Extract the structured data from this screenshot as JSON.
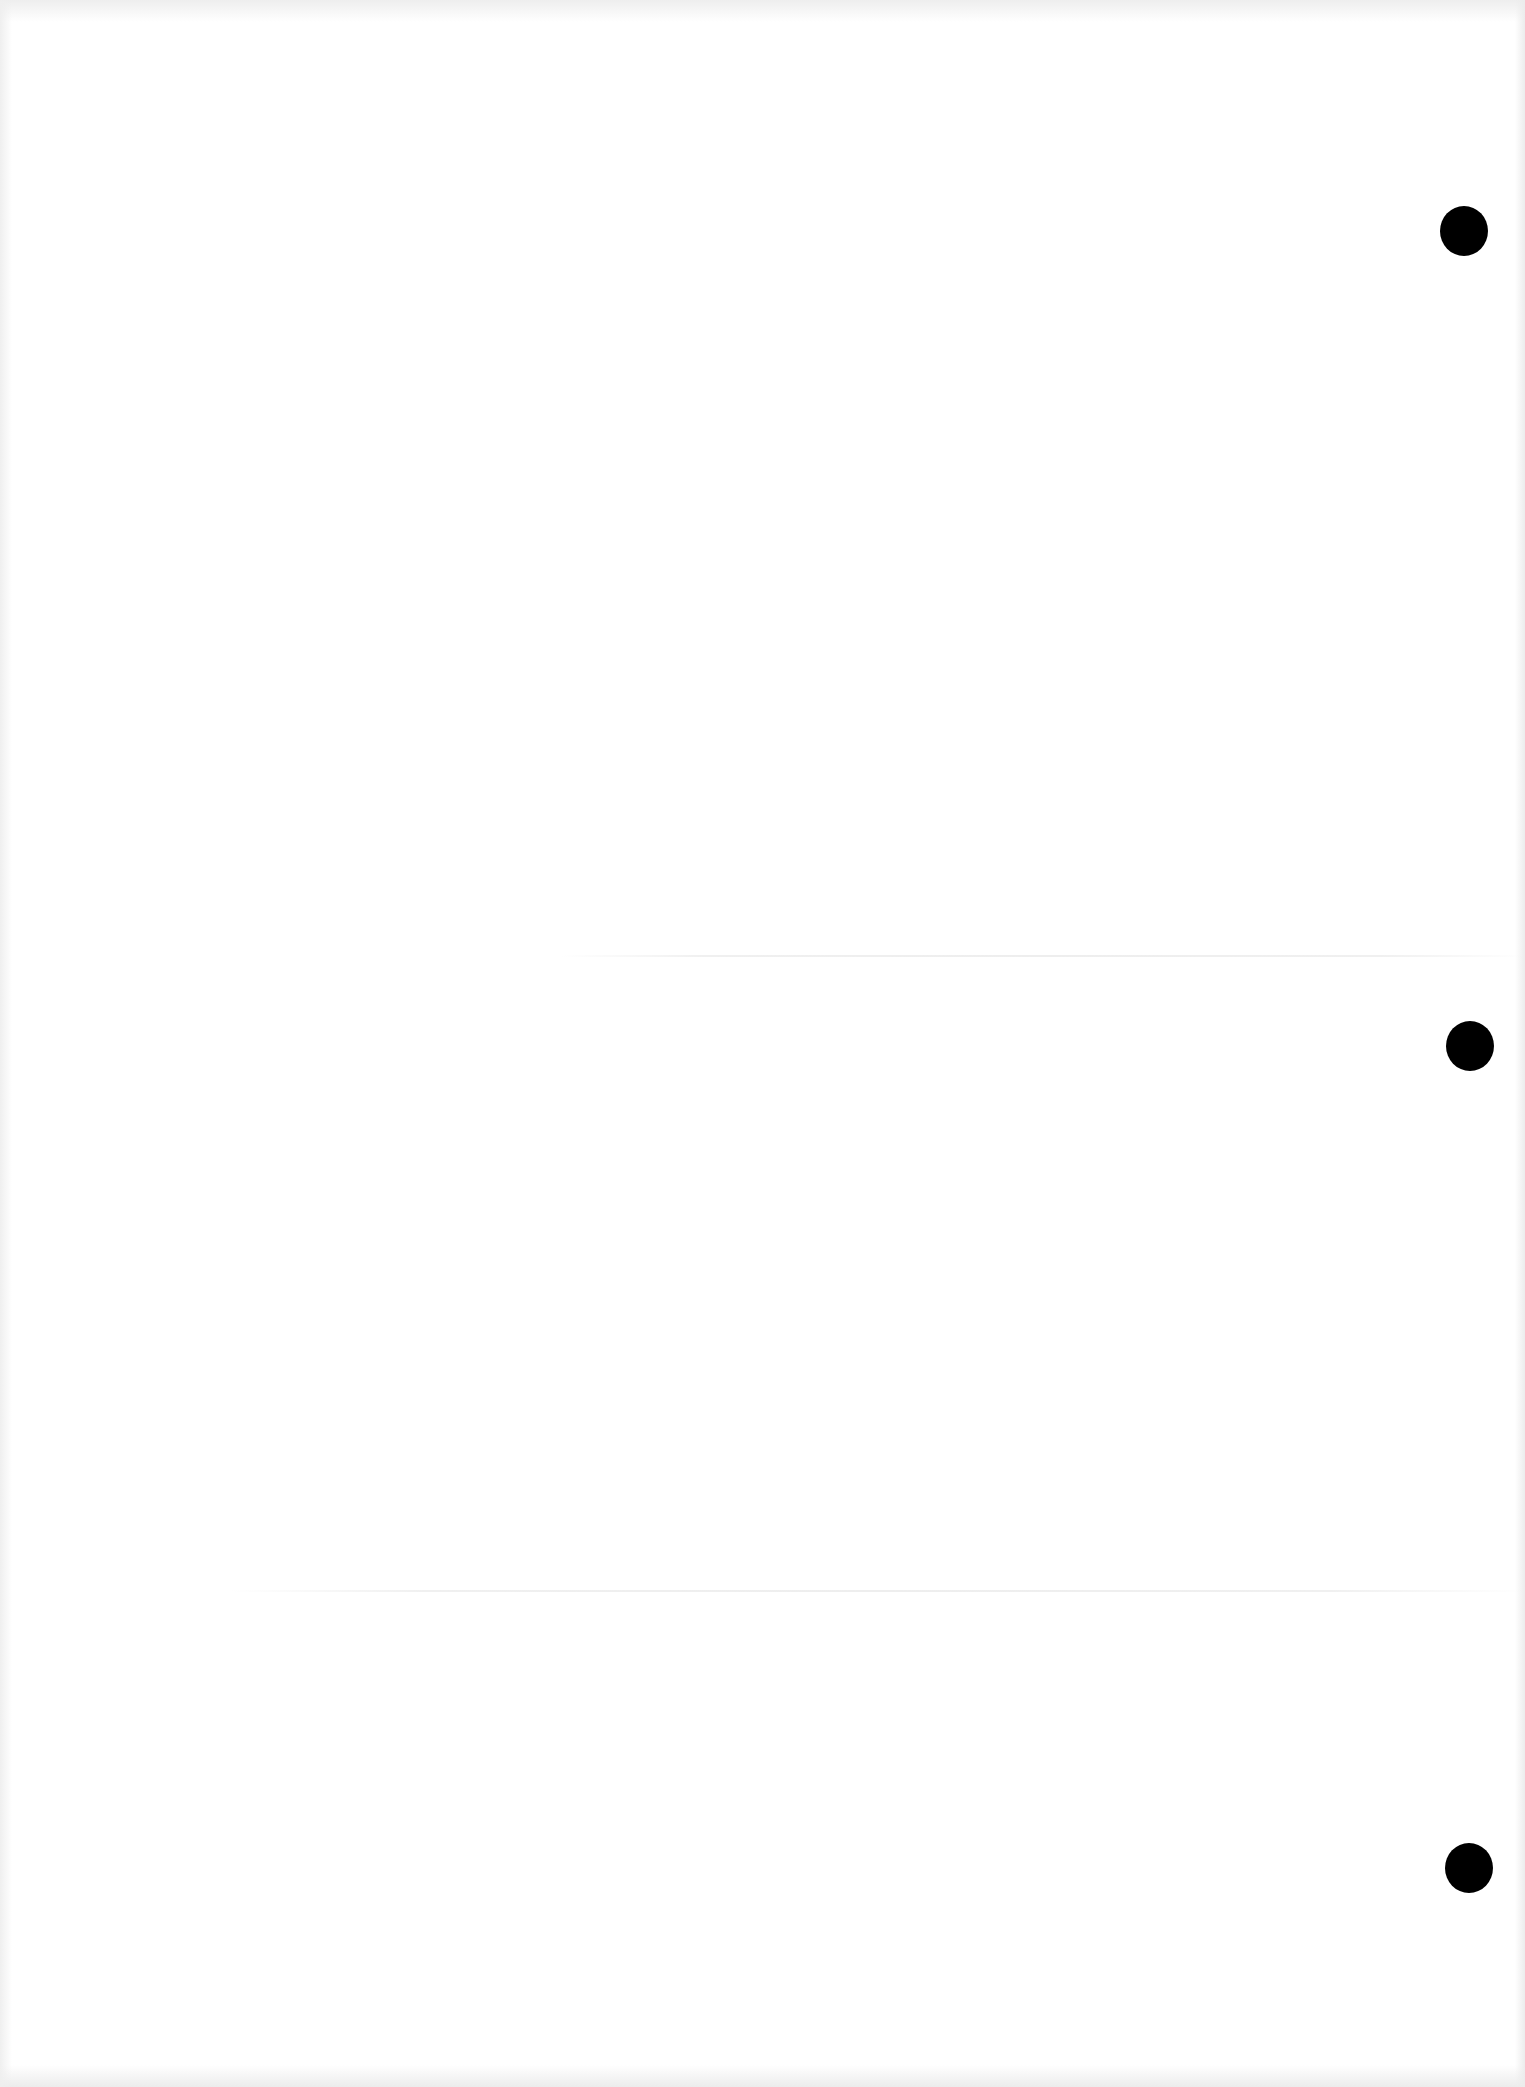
{
  "document": {
    "type": "blank-hole-punched-sheet",
    "text_content": "",
    "background_color": "#ffffff",
    "punch_holes": [
      {
        "id": "top",
        "center_x": 1464,
        "center_y": 231,
        "diameter": 48,
        "color": "#000000"
      },
      {
        "id": "middle",
        "center_x": 1470,
        "center_y": 1046,
        "diameter": 48,
        "color": "#000000"
      },
      {
        "id": "bottom",
        "center_x": 1469,
        "center_y": 1868,
        "diameter": 48,
        "color": "#000000"
      }
    ]
  }
}
